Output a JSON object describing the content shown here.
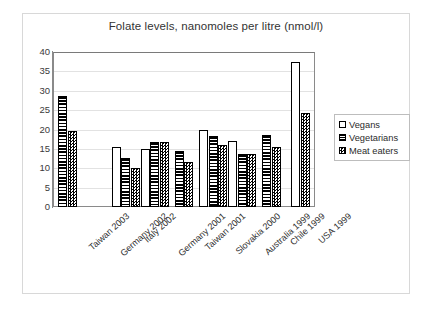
{
  "chart_data": {
    "type": "bar",
    "title": "Folate levels, nanomoles per litre (nmol/l)",
    "xlabel": "",
    "ylabel": "",
    "ylim": [
      0,
      40
    ],
    "yticks": [
      0,
      5,
      10,
      15,
      20,
      25,
      30,
      35,
      40
    ],
    "grid": true,
    "legend_position": "right",
    "categories": [
      "Taiwan 2003",
      "Germany 2002",
      "Italy 2002",
      "Germany 2001",
      "Taiwan 2001",
      "Slovakia 2000",
      "Australia 1999",
      "Chile 1999",
      "USA 1999"
    ],
    "series": [
      {
        "name": "Vegans",
        "pattern": "solid-white",
        "values": [
          null,
          null,
          15.5,
          15.0,
          null,
          19.8,
          17.0,
          null,
          37.3
        ]
      },
      {
        "name": "Vegetarians",
        "pattern": "horizontal-stripes",
        "values": [
          28.6,
          null,
          12.6,
          16.8,
          14.5,
          18.4,
          13.7,
          18.6,
          null
        ]
      },
      {
        "name": "Meat eaters",
        "pattern": "checkerboard",
        "values": [
          19.7,
          null,
          10.0,
          16.8,
          11.6,
          16.0,
          13.6,
          15.5,
          24.2
        ]
      }
    ]
  },
  "legend": {
    "items": [
      {
        "label": "Vegans",
        "swatch": "square-empty-icon"
      },
      {
        "label": "Vegetarians",
        "swatch": "square-striped-icon"
      },
      {
        "label": "Meat eaters",
        "swatch": "square-checkered-icon"
      }
    ]
  },
  "colors": {
    "plot_border": "#8a8a8a",
    "frame_border": "#d8d8d8",
    "gridline": "#e2e2e2",
    "bar_outline": "#000000",
    "bar_fill": "#ffffff",
    "text": "#2e2e2e"
  }
}
